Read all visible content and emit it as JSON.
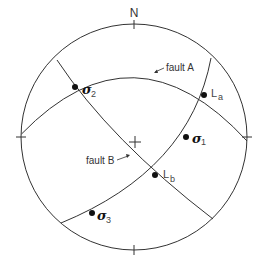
{
  "diagram": {
    "type": "stereonet",
    "north_label": "N",
    "center_mark": "+",
    "line_color": "#333333",
    "point_color": "#111111",
    "labels": {
      "fault_a": "fault A",
      "fault_b": "fault B",
      "sigma_symbol": "σ",
      "sigma1_sub": "1",
      "sigma2_sub": "2",
      "sigma3_sub": "3",
      "l_symbol": "L",
      "la_sub": "a",
      "lb_sub": "b"
    },
    "points": [
      {
        "name": "sigma-2",
        "label": "σ2"
      },
      {
        "name": "L-a",
        "label": "La"
      },
      {
        "name": "sigma-1",
        "label": "σ1"
      },
      {
        "name": "L-b",
        "label": "Lb"
      },
      {
        "name": "sigma-3",
        "label": "σ3"
      }
    ]
  }
}
